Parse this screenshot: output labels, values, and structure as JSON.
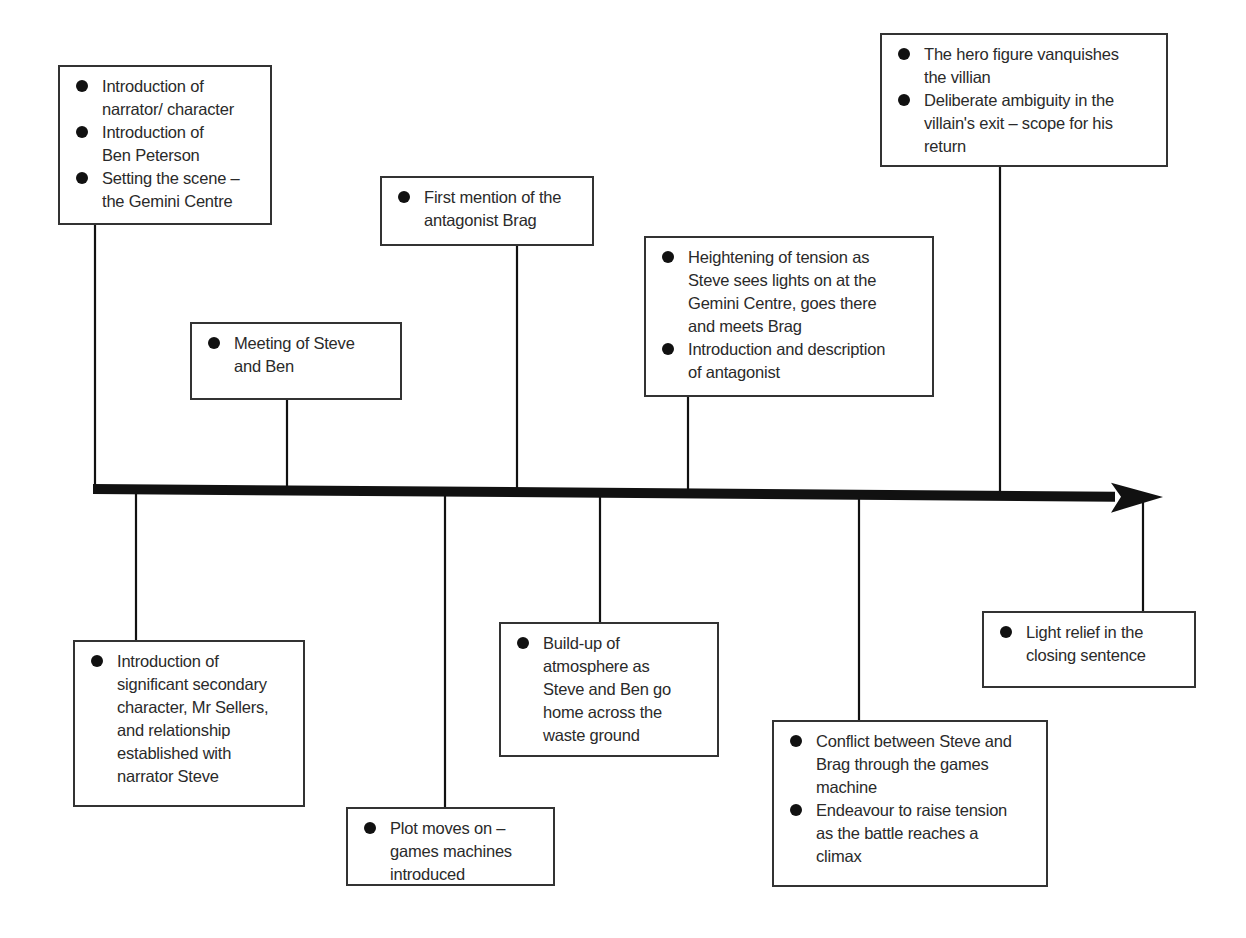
{
  "diagram": {
    "type": "story-structure-timeline",
    "axis": {
      "x_start": 93,
      "y_start": 489,
      "x_end": 1163,
      "y_end": 497,
      "arrow": "right"
    },
    "colors": {
      "line": "#111111",
      "box_border": "#333333",
      "text": "#2a2a2a",
      "bullet": "#111111"
    },
    "events": [
      {
        "id": "e1",
        "side": "above",
        "box": {
          "x": 58,
          "y": 65,
          "w": 214,
          "h": 160
        },
        "connector_x": 95,
        "bullets": [
          "Introduction of narrator/ character",
          "Introduction of Ben Peterson",
          "Setting the scene – the Gemini Centre"
        ],
        "lines": [
          [
            "Introduction of",
            "narrator/ character"
          ],
          [
            "Introduction of",
            "Ben Peterson"
          ],
          [
            "Setting the scene –",
            "the Gemini Centre"
          ]
        ]
      },
      {
        "id": "e2",
        "side": "below",
        "box": {
          "x": 73,
          "y": 640,
          "w": 232,
          "h": 167
        },
        "connector_x": 136,
        "bullets": [
          "Introduction of significant secondary character, Mr Sellers, and relationship established with narrator Steve"
        ],
        "lines": [
          [
            "Introduction of",
            "significant secondary",
            "character, Mr Sellers,",
            "and relationship",
            "established with",
            "narrator Steve"
          ]
        ]
      },
      {
        "id": "e3",
        "side": "above",
        "box": {
          "x": 190,
          "y": 322,
          "w": 212,
          "h": 78
        },
        "connector_x": 287,
        "bullets": [
          "Meeting of Steve and Ben"
        ],
        "lines": [
          [
            "Meeting of Steve",
            "and Ben"
          ]
        ]
      },
      {
        "id": "e4",
        "side": "below",
        "box": {
          "x": 346,
          "y": 807,
          "w": 209,
          "h": 79
        },
        "connector_x": 445,
        "bullets": [
          "Plot moves on – games machines introduced"
        ],
        "lines": [
          [
            "Plot moves on –",
            "games machines",
            "introduced"
          ]
        ]
      },
      {
        "id": "e5",
        "side": "above",
        "box": {
          "x": 380,
          "y": 176,
          "w": 214,
          "h": 70
        },
        "connector_x": 517,
        "bullets": [
          "First mention of the antagonist Brag"
        ],
        "lines": [
          [
            "First mention of the",
            "antagonist Brag"
          ]
        ]
      },
      {
        "id": "e6",
        "side": "below",
        "box": {
          "x": 499,
          "y": 622,
          "w": 220,
          "h": 135
        },
        "connector_x": 600,
        "bullets": [
          "Build-up of atmosphere as Steve and Ben go home across the waste ground"
        ],
        "lines": [
          [
            "Build-up of",
            "atmosphere as",
            "Steve and Ben go",
            "home across the",
            "waste ground"
          ]
        ]
      },
      {
        "id": "e7",
        "side": "above",
        "box": {
          "x": 644,
          "y": 236,
          "w": 290,
          "h": 161
        },
        "connector_x": 688,
        "bullets": [
          "Heightening of tension as Steve sees lights on at the Gemini Centre, goes there and meets Brag",
          "Introduction and description of antagonist"
        ],
        "lines": [
          [
            "Heightening of tension as",
            "Steve sees lights on at the",
            "Gemini Centre, goes there",
            "and meets Brag"
          ],
          [
            "Introduction and description",
            "of antagonist"
          ]
        ]
      },
      {
        "id": "e8",
        "side": "below",
        "box": {
          "x": 772,
          "y": 720,
          "w": 276,
          "h": 167
        },
        "connector_x": 859,
        "bullets": [
          "Conflict between Steve and Brag through the games machine",
          "Endeavour to raise tension as the battle reaches a climax"
        ],
        "lines": [
          [
            "Conflict between Steve and",
            "Brag through the games",
            "machine"
          ],
          [
            "Endeavour to raise tension",
            "as the battle reaches a",
            "climax"
          ]
        ]
      },
      {
        "id": "e9",
        "side": "above",
        "box": {
          "x": 880,
          "y": 33,
          "w": 288,
          "h": 134
        },
        "connector_x": 1000,
        "bullets": [
          "The hero figure vanquishes the villian",
          "Deliberate ambiguity in the villain's exit – scope for his return"
        ],
        "lines": [
          [
            "The hero figure vanquishes",
            "the villian"
          ],
          [
            "Deliberate ambiguity in the",
            "villain's exit – scope for his",
            "return"
          ]
        ]
      },
      {
        "id": "e10",
        "side": "below",
        "box": {
          "x": 982,
          "y": 611,
          "w": 214,
          "h": 77
        },
        "connector_x": 1143,
        "bullets": [
          "Light relief in the closing sentence"
        ],
        "lines": [
          [
            "Light relief in the",
            "closing sentence"
          ]
        ]
      }
    ]
  }
}
